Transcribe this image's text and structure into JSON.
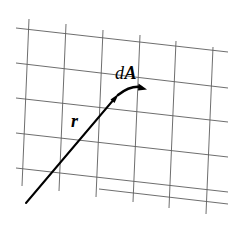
{
  "figure": {
    "background_color": "#ffffff",
    "width": 233,
    "height": 227,
    "labels": [
      {
        "id": "dA",
        "name": "label-dA",
        "differential": "d",
        "vector_symbol": "A",
        "text": "dA",
        "style": "italic d, bold italic A",
        "x": 115,
        "y": 64,
        "font_size": 18,
        "color": "#000000"
      },
      {
        "id": "r",
        "name": "label-r",
        "text": "r",
        "style": "bold italic r",
        "x": 71,
        "y": 112,
        "font_size": 18,
        "color": "#000000"
      }
    ],
    "grid": {
      "description": "skewed parallelogram mesh representing a surface patch",
      "color": "#5e5e5e",
      "stroke_width": 0.9,
      "rows": 5,
      "columns": 6,
      "horizontal_lines": [
        {
          "x1": 16,
          "y1": 28,
          "x2": 228,
          "y2": 52
        },
        {
          "x1": 16,
          "y1": 63,
          "x2": 228,
          "y2": 88
        },
        {
          "x1": 16,
          "y1": 98,
          "x2": 228,
          "y2": 122
        },
        {
          "x1": 16,
          "y1": 133,
          "x2": 228,
          "y2": 157
        },
        {
          "x1": 16,
          "y1": 168,
          "x2": 228,
          "y2": 192
        },
        {
          "x1": 99,
          "y1": 189,
          "x2": 228,
          "y2": 204
        }
      ],
      "vertical_lines": [
        {
          "x1": 29,
          "y1": 19,
          "x2": 22,
          "y2": 186
        },
        {
          "x1": 66,
          "y1": 24,
          "x2": 59,
          "y2": 191
        },
        {
          "x1": 103,
          "y1": 30,
          "x2": 96,
          "y2": 197
        },
        {
          "x1": 140,
          "y1": 35,
          "x2": 133,
          "y2": 202
        },
        {
          "x1": 176,
          "y1": 41,
          "x2": 169,
          "y2": 208
        },
        {
          "x1": 213,
          "y1": 47,
          "x2": 206,
          "y2": 214
        }
      ]
    },
    "vectors": [
      {
        "id": "r",
        "name": "position-vector-r",
        "label": "r",
        "from": {
          "x": 26,
          "y": 203
        },
        "to": {
          "x": 118,
          "y": 95
        },
        "stroke_width": 2.0,
        "color": "#000000",
        "arrowhead": true
      },
      {
        "id": "dA",
        "name": "area-element-vector-dA",
        "label": "dA",
        "from": {
          "x": 118,
          "y": 95
        },
        "to": {
          "x": 146,
          "y": 86
        },
        "stroke_width": 2.4,
        "color": "#000000",
        "arrowhead": true,
        "curved": true
      }
    ]
  }
}
